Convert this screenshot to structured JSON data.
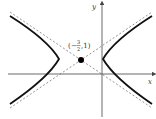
{
  "diagram": {
    "type": "hyperbola",
    "center_label": {
      "open": "(",
      "sign": "−",
      "num": "3",
      "den": "2",
      "rest": ",1)"
    },
    "center": {
      "x": -1.5,
      "y": 1
    },
    "axes": {
      "x_label": "x",
      "y_label": "y"
    },
    "colors": {
      "curve": "#111111",
      "axis": "#444444",
      "asymptote": "#666666",
      "dot": "#000000"
    }
  }
}
